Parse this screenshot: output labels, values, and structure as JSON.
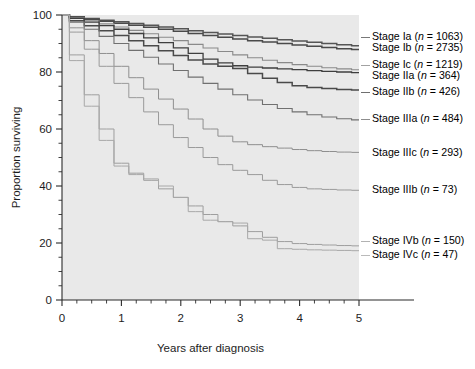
{
  "chart_data": {
    "type": "line",
    "title": "",
    "xlabel": "Years after diagnosis",
    "ylabel": "Proportion surviving",
    "xlim": [
      0,
      5
    ],
    "ylim": [
      0,
      100
    ],
    "grid": false,
    "legend_position": "right",
    "x_ticks": [
      0,
      1,
      2,
      3,
      4,
      5
    ],
    "x_tick_labels": [
      "0",
      "1",
      "2",
      "3",
      "4",
      "5"
    ],
    "x_minor_step": 0.25,
    "y_ticks": [
      0,
      20,
      40,
      60,
      80,
      100
    ],
    "y_tick_labels": [
      "0",
      "20",
      "40",
      "60",
      "80",
      "100"
    ],
    "y_minor_step": 5,
    "plot_background": "#e9e9e9",
    "series": [
      {
        "name": "Stage Ia",
        "n": 1063,
        "legend_label": "Stage Ia (n = 1063)",
        "color": "#555555",
        "width": 1.5,
        "x": [
          0,
          0.25,
          0.5,
          0.75,
          1.0,
          1.25,
          1.5,
          1.75,
          2.0,
          2.25,
          2.5,
          2.75,
          3.0,
          3.25,
          3.5,
          3.75,
          4.0,
          4.25,
          4.5,
          4.75,
          5.0
        ],
        "values": [
          100,
          99.4,
          98.8,
          98.2,
          97.6,
          97.0,
          96.4,
          95.8,
          95.2,
          94.5,
          93.9,
          93.3,
          92.8,
          92.3,
          91.8,
          91.3,
          90.9,
          90.4,
          90.0,
          89.6,
          89.2
        ]
      },
      {
        "name": "Stage Ib",
        "n": 2735,
        "legend_label": "Stage Ib (n = 2735)",
        "color": "#4a4a4a",
        "width": 1.5,
        "x": [
          0,
          0.25,
          0.5,
          0.75,
          1.0,
          1.25,
          1.5,
          1.75,
          2.0,
          2.25,
          2.5,
          2.75,
          3.0,
          3.25,
          3.5,
          3.75,
          4.0,
          4.25,
          4.5,
          4.75,
          5.0
        ],
        "values": [
          100,
          99.2,
          98.5,
          97.8,
          97.1,
          96.4,
          95.7,
          95.0,
          94.3,
          93.5,
          92.8,
          92.2,
          91.6,
          91.0,
          90.5,
          90.0,
          89.5,
          89.0,
          88.6,
          88.2,
          87.9
        ]
      },
      {
        "name": "Stage Ic",
        "n": 1219,
        "legend_label": "Stage Ic (n = 1219)",
        "color": "#8a8a8a",
        "width": 1.1,
        "x": [
          0,
          0.25,
          0.5,
          0.75,
          1.0,
          1.25,
          1.5,
          1.75,
          2.0,
          2.25,
          2.5,
          2.75,
          3.0,
          3.25,
          3.5,
          3.75,
          4.0,
          4.25,
          4.5,
          4.75,
          5.0
        ],
        "values": [
          100,
          99.0,
          98.0,
          96.9,
          95.8,
          94.6,
          93.4,
          92.2,
          91.0,
          89.7,
          88.4,
          87.2,
          86.0,
          85.0,
          84.1,
          83.3,
          82.6,
          82.0,
          81.5,
          81.1,
          80.8
        ]
      },
      {
        "name": "Stage IIa",
        "n": 364,
        "legend_label": "Stage IIa (n = 364)",
        "color": "#3f3f3f",
        "width": 1.3,
        "x": [
          0,
          0.25,
          0.5,
          0.75,
          1.0,
          1.25,
          1.5,
          1.75,
          2.0,
          2.25,
          2.5,
          2.75,
          3.0,
          3.25,
          3.5,
          3.75,
          4.0,
          4.25,
          4.5,
          4.75,
          5.0
        ],
        "values": [
          100,
          98.8,
          97.5,
          96.3,
          95.0,
          93.5,
          92.0,
          90.3,
          88.5,
          86.5,
          84.5,
          83.2,
          82.2,
          81.7,
          81.4,
          81.1,
          80.8,
          80.5,
          80.2,
          80.0,
          79.8
        ]
      },
      {
        "name": "Stage IIb",
        "n": 426,
        "legend_label": "Stage IIb (n = 426)",
        "color": "#4a4a4a",
        "width": 1.5,
        "x": [
          0,
          0.25,
          0.5,
          0.75,
          1.0,
          1.25,
          1.5,
          1.75,
          2.0,
          2.25,
          2.5,
          2.75,
          3.0,
          3.25,
          3.5,
          3.75,
          4.0,
          4.25,
          4.5,
          4.75,
          5.0
        ],
        "values": [
          100,
          98.0,
          96.2,
          94.5,
          92.8,
          91.0,
          89.2,
          87.5,
          85.8,
          84.2,
          82.8,
          82.0,
          81.2,
          79.5,
          77.8,
          76.3,
          75.2,
          74.6,
          74.2,
          73.9,
          73.7
        ]
      },
      {
        "name": "Stage IIIa",
        "n": 484,
        "legend_label": "Stage IIIa (n = 484)",
        "color": "#707070",
        "width": 1.1,
        "x": [
          0,
          0.25,
          0.5,
          0.75,
          1.0,
          1.25,
          1.5,
          1.75,
          2.0,
          2.25,
          2.5,
          2.75,
          3.0,
          3.25,
          3.5,
          3.75,
          4.0,
          4.25,
          4.5,
          4.75,
          5.0
        ],
        "values": [
          100,
          97.5,
          95.0,
          92.5,
          90.0,
          87.6,
          85.2,
          82.8,
          80.5,
          78.2,
          76.0,
          74.0,
          72.0,
          70.2,
          68.6,
          67.2,
          66.0,
          65.0,
          64.2,
          63.6,
          63.2
        ]
      },
      {
        "name": "Stage IIIc",
        "n": 293,
        "legend_label": "Stage IIIc (n = 293)",
        "color": "#8f8f8f",
        "width": 1.0,
        "x": [
          0,
          0.25,
          0.5,
          0.75,
          1.0,
          1.25,
          1.5,
          1.75,
          2.0,
          2.25,
          2.5,
          2.75,
          3.0,
          3.25,
          3.5,
          3.75,
          4.0,
          4.25,
          4.5,
          4.75,
          5.0
        ],
        "values": [
          100,
          95.5,
          91.0,
          86.5,
          82.0,
          78.0,
          74.0,
          70.5,
          67.0,
          63.5,
          60.0,
          57.5,
          55.5,
          54.5,
          53.8,
          53.3,
          52.8,
          52.4,
          52.1,
          51.9,
          51.8
        ]
      },
      {
        "name": "Stage IIIb",
        "n": 73,
        "legend_label": "Stage IIIb (n = 73)",
        "color": "#9a9a9a",
        "width": 1.0,
        "x": [
          0,
          0.25,
          0.5,
          0.75,
          1.0,
          1.25,
          1.5,
          1.75,
          2.0,
          2.25,
          2.5,
          2.75,
          3.0,
          3.25,
          3.5,
          3.75,
          4.0,
          4.25,
          4.5,
          4.75,
          5.0
        ],
        "values": [
          100,
          94.0,
          88.0,
          82.0,
          76.0,
          71.0,
          66.0,
          61.5,
          57.0,
          53.5,
          50.0,
          47.5,
          45.5,
          44.0,
          42.0,
          40.5,
          39.5,
          39.0,
          38.8,
          38.6,
          38.5
        ]
      },
      {
        "name": "Stage IVb",
        "n": 150,
        "legend_label": "Stage IVb (n = 150)",
        "color": "#9e9e9e",
        "width": 1.0,
        "x": [
          0,
          0.25,
          0.5,
          0.75,
          1.0,
          1.25,
          1.5,
          1.75,
          2.0,
          2.25,
          2.5,
          2.75,
          3.0,
          3.25,
          3.5,
          3.75,
          4.0,
          4.25,
          4.5,
          4.75,
          5.0
        ],
        "values": [
          100,
          86.0,
          72.0,
          60.0,
          48.0,
          44.5,
          42.0,
          39.0,
          36.0,
          33.0,
          30.0,
          27.5,
          26.0,
          24.0,
          22.0,
          20.5,
          19.8,
          19.5,
          19.3,
          19.1,
          19.0
        ]
      },
      {
        "name": "Stage IVc",
        "n": 47,
        "legend_label": "Stage IVc (n = 47)",
        "color": "#a8a8a8",
        "width": 1.0,
        "x": [
          0,
          0.25,
          0.5,
          0.75,
          1.0,
          1.25,
          1.5,
          1.75,
          2.0,
          2.25,
          2.5,
          2.75,
          3.0,
          3.25,
          3.5,
          3.75,
          4.0,
          4.25,
          4.5,
          4.75,
          5.0
        ],
        "values": [
          100,
          84.0,
          68.0,
          56.0,
          47.0,
          44.0,
          42.5,
          40.0,
          36.0,
          31.0,
          28.0,
          27.5,
          27.0,
          21.5,
          21.0,
          18.0,
          17.8,
          17.6,
          17.5,
          17.4,
          17.3
        ]
      }
    ],
    "legend_entries": [
      {
        "label": "Stage Ia (n = 1063)",
        "stage": "Stage Ia",
        "n": "1063",
        "y": 41,
        "leader": true
      },
      {
        "label": "Stage Ib (n = 2735)",
        "stage": "Stage Ib",
        "n": "2735",
        "y": 52,
        "leader": false
      },
      {
        "label": "Stage Ic (n = 1219)",
        "stage": "Stage Ic",
        "n": "1219",
        "y": 69,
        "leader": true
      },
      {
        "label": "Stage IIa (n = 364)",
        "stage": "Stage IIa",
        "n": "364",
        "y": 80,
        "leader": false
      },
      {
        "label": "Stage IIb (n = 426)",
        "stage": "Stage IIb",
        "n": "426",
        "y": 96,
        "leader": true
      },
      {
        "label": "Stage IIIa (n = 484)",
        "stage": "Stage IIIa",
        "n": "484",
        "y": 123,
        "leader": true
      },
      {
        "label": "Stage IIIc (n = 293)",
        "stage": "Stage IIIc",
        "n": "293",
        "y": 157,
        "leader": false
      },
      {
        "label": "Stage IIIb (n = 73)",
        "stage": "Stage IIIb",
        "n": "73",
        "y": 194,
        "leader": false
      },
      {
        "label": "Stage IVb (n = 150)",
        "stage": "Stage IVb",
        "n": "150",
        "y": 245,
        "leader": true
      },
      {
        "label": "Stage IVc (n = 47)",
        "stage": "Stage IVc",
        "n": "47",
        "y": 259,
        "leader": true
      }
    ]
  }
}
